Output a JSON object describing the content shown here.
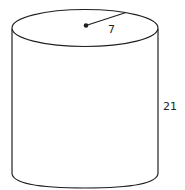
{
  "diagram": {
    "shape": "cylinder",
    "radius_label": "7",
    "height_label": "21",
    "stroke_color": "#231f20",
    "fill_color": "#ffffff"
  }
}
